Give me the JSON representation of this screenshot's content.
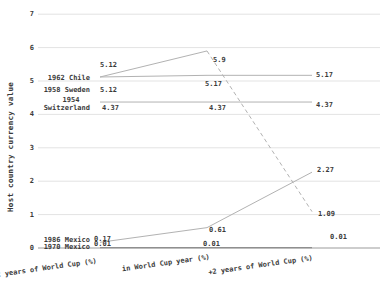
{
  "chart_data": {
    "type": "line",
    "title": "",
    "ylabel": "Host country currency value",
    "xlabel": "",
    "categories": [
      "-2 years of World Cup (%)",
      "in World Cup year (%)",
      "+2 years of World Cup (%)"
    ],
    "y_ticks": [
      0,
      1,
      2,
      3,
      4,
      5,
      6,
      7
    ],
    "ylim": [
      0,
      7
    ],
    "grid": true,
    "legend_position": "inline-left",
    "colors": {
      "text": "#3a3a3a",
      "grid": "#e3e3e3",
      "axis": "#9b9b9b",
      "line": "#b2b2b2",
      "line_dark": "#8f8f8f"
    },
    "series": [
      {
        "name": "1962 Chile",
        "name_lines": [
          "1962 Chile"
        ],
        "values": [
          5.12,
          5.9,
          1.09
        ],
        "point_labels": [
          "5.12",
          "5.9",
          "1.09"
        ],
        "segments": [
          "solid",
          "dashed"
        ],
        "color": "#b2b2b2"
      },
      {
        "name": "1958 Sweden",
        "name_lines": [
          "1958 Sweden"
        ],
        "values": [
          5.12,
          5.17,
          5.17
        ],
        "point_labels": [
          "5.12",
          "5.17",
          "5.17"
        ],
        "segments": [
          "solid",
          "solid"
        ],
        "color": "#b2b2b2"
      },
      {
        "name": "1954 Switzerland",
        "name_lines": [
          "1954",
          "Switzerland"
        ],
        "values": [
          4.37,
          4.37,
          4.37
        ],
        "point_labels": [
          "4.37",
          "4.37",
          "4.37"
        ],
        "segments": [
          "solid",
          "solid"
        ],
        "color": "#b2b2b2"
      },
      {
        "name": "1986 Mexico",
        "name_lines": [
          "1986 Mexico"
        ],
        "values": [
          0.17,
          0.61,
          2.27
        ],
        "point_labels": [
          "0.17",
          "0.61",
          "2.27"
        ],
        "segments": [
          "solid",
          "solid"
        ],
        "color": "#b2b2b2"
      },
      {
        "name": "1970 Mexico",
        "name_lines": [
          "1970 Mexico"
        ],
        "values": [
          0.01,
          0.01,
          0.01
        ],
        "point_labels": [
          "0.01",
          "0.01",
          "0.01"
        ],
        "segments": [
          "solid",
          "solid"
        ],
        "color": "#8f8f8f"
      }
    ]
  }
}
